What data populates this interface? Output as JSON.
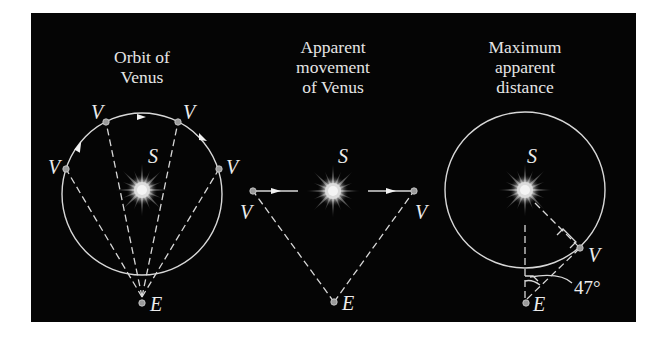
{
  "figure": {
    "background": "#050505",
    "line_color": "#d8d8d8",
    "panels": [
      {
        "id": "orbit",
        "title_lines": [
          "Orbit of",
          "Venus"
        ],
        "sun_label": "S",
        "earth_label": "E",
        "venus_labels": [
          "V",
          "V",
          "V",
          "V"
        ]
      },
      {
        "id": "apparent",
        "title_lines": [
          "Apparent",
          "movement",
          "of Venus"
        ],
        "sun_label": "S",
        "earth_label": "E",
        "venus_labels": [
          "V",
          "V"
        ]
      },
      {
        "id": "maximum",
        "title_lines": [
          "Maximum",
          "apparent",
          "distance"
        ],
        "sun_label": "S",
        "earth_label": "E",
        "venus_labels": [
          "V"
        ],
        "angle_label": "47°"
      }
    ]
  }
}
